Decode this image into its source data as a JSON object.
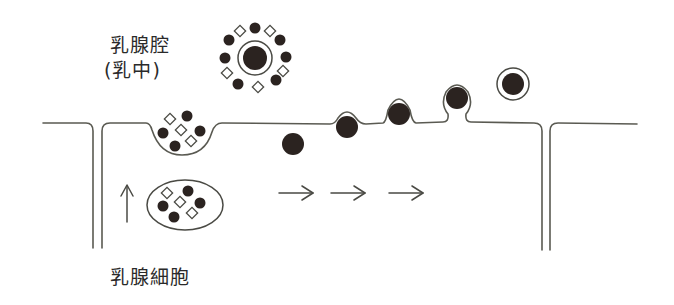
{
  "labels": {
    "lumen": "乳腺腔",
    "milk": "(乳中)",
    "cell": "乳腺細胞"
  },
  "colors": {
    "ink": "#2b2320",
    "line": "#5a5a52",
    "background": "#ffffff"
  },
  "diagram": {
    "stages": [
      {
        "name": "vesicle-in-cytoplasm",
        "cx": 185,
        "cy": 205
      },
      {
        "name": "exocytosis-cup",
        "cx": 182,
        "cy": 135
      },
      {
        "name": "lipid-droplet-cytoplasm",
        "cx": 293,
        "cy": 144
      },
      {
        "name": "lipid-droplet-budding-1",
        "cx": 347,
        "cy": 127
      },
      {
        "name": "lipid-droplet-budding-2",
        "cx": 399,
        "cy": 114
      },
      {
        "name": "lipid-droplet-pinching",
        "cx": 457,
        "cy": 98
      },
      {
        "name": "milk-fat-globule-released",
        "cx": 513,
        "cy": 84
      },
      {
        "name": "globule-in-milk-with-proteins",
        "cx": 255,
        "cy": 58
      }
    ],
    "arrows": [
      {
        "direction": "up",
        "x": 127,
        "y1": 222,
        "y2": 185
      },
      {
        "direction": "right",
        "x1": 279,
        "x2": 313,
        "y": 193
      },
      {
        "direction": "right",
        "x1": 331,
        "x2": 365,
        "y": 193
      },
      {
        "direction": "right",
        "x1": 389,
        "x2": 423,
        "y": 193
      }
    ]
  }
}
